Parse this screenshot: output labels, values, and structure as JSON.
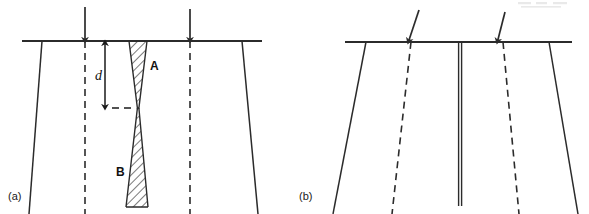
{
  "figure": {
    "background_color": "#ffffff",
    "line_color": "#2b2b2b",
    "panels": [
      {
        "id": "a",
        "label": "(a)",
        "label_position": {
          "x": 8,
          "y": 200
        },
        "description": "Cross-section with vertical load arrows, dashed vertical reference lines, and an hourglass pair of hatched wedge zones A and B meeting at a pinch point at depth d.",
        "ground_surface": {
          "name": "ground-surface-line",
          "x1": 22,
          "y1": 41,
          "x2": 262,
          "y2": 41
        },
        "outer_edges": [
          {
            "name": "left-outer-edge",
            "x1": 42,
            "y1": 41,
            "x2": 29,
            "y2": 214
          },
          {
            "name": "right-outer-edge",
            "x1": 242,
            "y1": 41,
            "x2": 258,
            "y2": 214
          }
        ],
        "dashed_reference_lines": [
          {
            "name": "left-dashed-reference",
            "x1": 85,
            "y1": 41,
            "x2": 85,
            "y2": 214
          },
          {
            "name": "right-dashed-reference",
            "x1": 190,
            "y1": 41,
            "x2": 190,
            "y2": 214
          }
        ],
        "load_arrows": [
          {
            "name": "left-load-arrow",
            "x1": 85,
            "y1": 7,
            "x2": 85,
            "y2": 41,
            "slanted": false
          },
          {
            "name": "right-load-arrow",
            "x1": 190,
            "y1": 9,
            "x2": 190,
            "y2": 41,
            "slanted": false
          }
        ],
        "zones": [
          {
            "name": "zone-a",
            "label": "A",
            "label_position": {
              "x": 150,
              "y": 70
            },
            "shape": "downward-tapering-wedge",
            "hatched": true,
            "top_left_x": 129,
            "top_right_x": 147,
            "top_y": 41,
            "apex_x": 138,
            "apex_y": 108
          },
          {
            "name": "zone-b",
            "label": "B",
            "label_position": {
              "x": 116,
              "y": 176
            },
            "shape": "downward-widening-wedge",
            "hatched": true,
            "apex_x": 138,
            "apex_y": 108,
            "bottom_left_x": 126,
            "bottom_right_x": 148,
            "bottom_y": 207
          }
        ],
        "dimension": {
          "name": "depth-dimension-d",
          "symbol": "d",
          "symbol_position": {
            "x": 96,
            "y": 79
          },
          "arrow_x": 105,
          "arrow_top_y": 42,
          "arrow_bottom_y": 108,
          "double_headed": true,
          "tick_dash": {
            "x1": 113,
            "y1": 108,
            "x2": 136,
            "y2": 108
          }
        }
      },
      {
        "id": "b",
        "label": "(b)",
        "label_position": {
          "x": 299,
          "y": 200
        },
        "description": "Cross-section with two slanted load arrows, two inward-leaning dashed reference lines, and a single narrow vertical closed crack at the centre.",
        "ground_surface": {
          "name": "ground-surface-line",
          "x1": 345,
          "y1": 42,
          "x2": 572,
          "y2": 42
        },
        "outer_edges": [
          {
            "name": "left-outer-edge",
            "x1": 366,
            "y1": 42,
            "x2": 333,
            "y2": 214
          },
          {
            "name": "right-outer-edge",
            "x1": 549,
            "y1": 42,
            "x2": 578,
            "y2": 214
          }
        ],
        "dashed_reference_lines": [
          {
            "name": "left-dashed-reference",
            "x1": 411,
            "y1": 42,
            "x2": 392,
            "y2": 214
          },
          {
            "name": "right-dashed-reference",
            "x1": 503,
            "y1": 42,
            "x2": 519,
            "y2": 214
          }
        ],
        "load_arrows": [
          {
            "name": "left-load-arrow",
            "x1": 419,
            "y1": 10,
            "x2": 408,
            "y2": 42,
            "slanted": true
          },
          {
            "name": "right-load-arrow",
            "x1": 505,
            "y1": 12,
            "x2": 497,
            "y2": 42,
            "slanted": true
          }
        ],
        "centre_feature": {
          "name": "closed-crack-sliver",
          "left_x": 458.5,
          "right_x": 461.5,
          "top_y": 42,
          "bottom_y": 206,
          "hatched": false
        }
      }
    ]
  }
}
